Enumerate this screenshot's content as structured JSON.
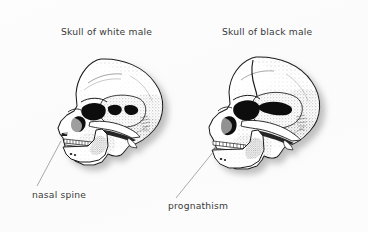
{
  "figure": {
    "name": "comparative-skull-morphology-figure",
    "background_color": "#fdfdfd",
    "text_color": "#3a3a3a",
    "ink_color": "#1b1b1b",
    "shadow_color": "#b9b9b9"
  },
  "titles": {
    "left": "Skull of white male",
    "right": "Skull of black male"
  },
  "annotations": {
    "left": {
      "label": "nasal spine",
      "target": "anterior nasal spine of left skull"
    },
    "right": {
      "label": "prognathism",
      "target": "projecting maxilla and mandible of right skull"
    }
  },
  "illustrations": [
    {
      "name": "skull-left",
      "view": "lateral",
      "style": "stippled pen-and-ink line drawing",
      "features": [
        "cranial vault",
        "orbit",
        "nasal aperture",
        "zygomatic arch",
        "maxillary teeth",
        "mandibular teeth",
        "mandible",
        "anterior nasal spine"
      ]
    },
    {
      "name": "skull-right",
      "view": "lateral",
      "style": "stippled pen-and-ink line drawing",
      "features": [
        "cranial vault",
        "coronal suture",
        "orbit",
        "nasal aperture",
        "zygomatic arch",
        "maxillary teeth",
        "mandibular teeth",
        "mandible",
        "prognathic jaw"
      ]
    }
  ]
}
